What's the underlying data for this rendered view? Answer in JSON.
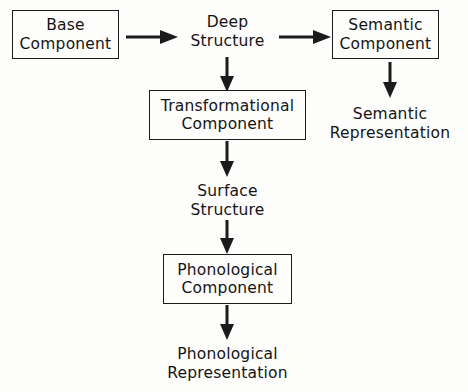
{
  "diagram": {
    "nodes": [
      {
        "id": "base",
        "label_line1": "Base",
        "label_line2": "Component",
        "boxed": true
      },
      {
        "id": "deep",
        "label_line1": "Deep",
        "label_line2": "Structure",
        "boxed": false
      },
      {
        "id": "semantic_component",
        "label_line1": "Semantic",
        "label_line2": "Component",
        "boxed": true
      },
      {
        "id": "semantic_representation",
        "label_line1": "Semantic",
        "label_line2": "Representation",
        "boxed": false
      },
      {
        "id": "transformational",
        "label_line1": "Transformational",
        "label_line2": "Component",
        "boxed": true
      },
      {
        "id": "surface",
        "label_line1": "Surface",
        "label_line2": "Structure",
        "boxed": false
      },
      {
        "id": "phonological_component",
        "label_line1": "Phonological",
        "label_line2": "Component",
        "boxed": true
      },
      {
        "id": "phonological_representation",
        "label_line1": "Phonological",
        "label_line2": "Representation",
        "boxed": false
      }
    ],
    "edges": [
      {
        "id": "base_to_deep",
        "from": "base",
        "to": "deep",
        "direction": "right"
      },
      {
        "id": "deep_to_semantic_component",
        "from": "deep",
        "to": "semantic_component",
        "direction": "right"
      },
      {
        "id": "deep_to_transformational",
        "from": "deep",
        "to": "transformational",
        "direction": "down"
      },
      {
        "id": "semantic_component_to_semantic_representation",
        "from": "semantic_component",
        "to": "semantic_representation",
        "direction": "down"
      },
      {
        "id": "transformational_to_surface",
        "from": "transformational",
        "to": "surface",
        "direction": "down"
      },
      {
        "id": "surface_to_phonological_component",
        "from": "surface",
        "to": "phonological_component",
        "direction": "down"
      },
      {
        "id": "phonological_component_to_phonological_representation",
        "from": "phonological_component",
        "to": "phonological_representation",
        "direction": "down"
      }
    ],
    "colors": {
      "background": "#fdfdfc",
      "stroke": "#1b1b1b",
      "text": "#141414"
    }
  }
}
